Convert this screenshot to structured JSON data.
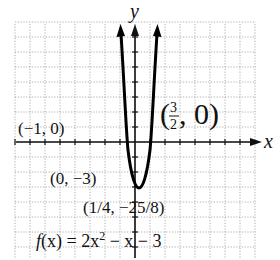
{
  "chart_data": {
    "type": "line",
    "title": "",
    "function": "f(x) = 2x^2 - x - 3",
    "xlabel": "x",
    "ylabel": "y",
    "grid": true,
    "series": [
      {
        "name": "f(x) = 2x² − x − 3",
        "x": [
          -1.5,
          -1,
          -0.5,
          0,
          0.25,
          0.5,
          1,
          1.5,
          2
        ],
        "y": [
          3,
          0,
          -2,
          -3,
          -3.125,
          -3,
          -2,
          0,
          3
        ]
      }
    ],
    "annotations": [
      {
        "label": "(−1, 0)",
        "x": -1,
        "y": 0
      },
      {
        "label": "(3/2, 0)",
        "x": 1.5,
        "y": 0
      },
      {
        "label": "(0, −3)",
        "x": 0,
        "y": -3
      },
      {
        "label": "(1/4, −25/8)",
        "x": 0.25,
        "y": -3.125
      }
    ]
  },
  "labels": {
    "x_axis": "x",
    "y_axis": "y",
    "point_neg1": "(−1, 0)",
    "point_3half_open": "(",
    "point_3half_num": "3",
    "point_3half_den": "2",
    "point_3half_rest": ", 0)",
    "point_0neg3": "(0, −3)",
    "vertex": "(1/4, −25/8)",
    "equation_f": "f",
    "equation_rest": "(x) = 2x",
    "equation_exp": "2",
    "equation_tail": " − x − 3"
  }
}
